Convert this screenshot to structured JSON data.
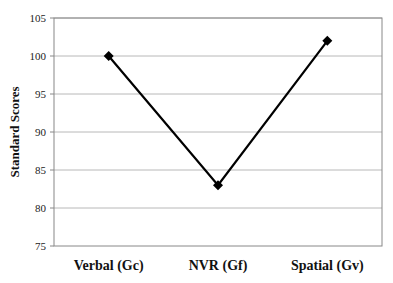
{
  "chart_data": {
    "type": "line",
    "title": "",
    "xlabel": "",
    "ylabel": "Standard Scores",
    "categories": [
      "Verbal (Gc)",
      "NVR (Gf)",
      "Spatial (Gv)"
    ],
    "series": [
      {
        "name": "Standard Scores",
        "values": [
          100,
          83,
          102
        ],
        "marker": "diamond",
        "color": "#000000"
      }
    ],
    "ylim": [
      75,
      105
    ],
    "yticks": [
      75,
      80,
      85,
      90,
      95,
      100,
      105
    ],
    "grid": true,
    "legend": "none"
  },
  "colors": {
    "line": "#000000",
    "grid": "#b8b8b8",
    "axis": "#888888"
  }
}
